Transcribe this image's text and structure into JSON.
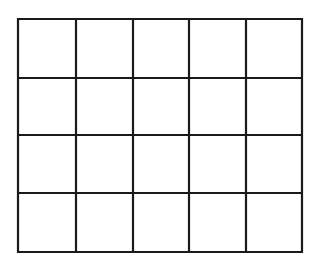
{
  "diagram": {
    "type": "grid",
    "rows": 4,
    "columns": 5,
    "line_color": "#1a1a1a",
    "background": "#ffffff",
    "x_lines": [
      18,
      76,
      133,
      189,
      246,
      302
    ],
    "y_lines": [
      19,
      78,
      135,
      193,
      252
    ]
  }
}
